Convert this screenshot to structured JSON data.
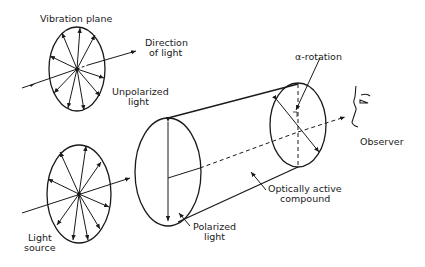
{
  "diagram": {
    "colors": {
      "ink": "#1a1a1a",
      "background": "#ffffff"
    },
    "labels": {
      "vibration_plane": "Vibration plane",
      "direction_of_light_1": "Direction",
      "direction_of_light_2": "of light",
      "unpolarized_1": "Unpolarized",
      "unpolarized_2": "light",
      "light_source_1": "Light",
      "light_source_2": "source",
      "polarized_1": "Polarized",
      "polarized_2": "light",
      "compound_1": "Optically active",
      "compound_2": "compound",
      "alpha_rotation": "α-rotation",
      "observer": "Observer"
    },
    "nodes": [
      {
        "id": "unpolarized-light-disc",
        "shape": "ellipse",
        "arrows": 12
      },
      {
        "id": "light-source-disc",
        "shape": "ellipse",
        "arrows": 12
      },
      {
        "id": "polarizer-end",
        "shape": "ellipse",
        "arrows": "vertical double"
      },
      {
        "id": "analyzer-end",
        "shape": "ellipse",
        "arrows": "rotated double"
      },
      {
        "id": "observer-face",
        "shape": "profile"
      }
    ],
    "edges": [
      {
        "from": "light-source-disc",
        "to": "polarizer-end",
        "label": "light beam"
      },
      {
        "from": "polarizer-end",
        "to": "analyzer-end",
        "label": "Optically active compound"
      },
      {
        "from": "analyzer-end",
        "to": "observer-face",
        "label": "dashed axis"
      }
    ]
  }
}
